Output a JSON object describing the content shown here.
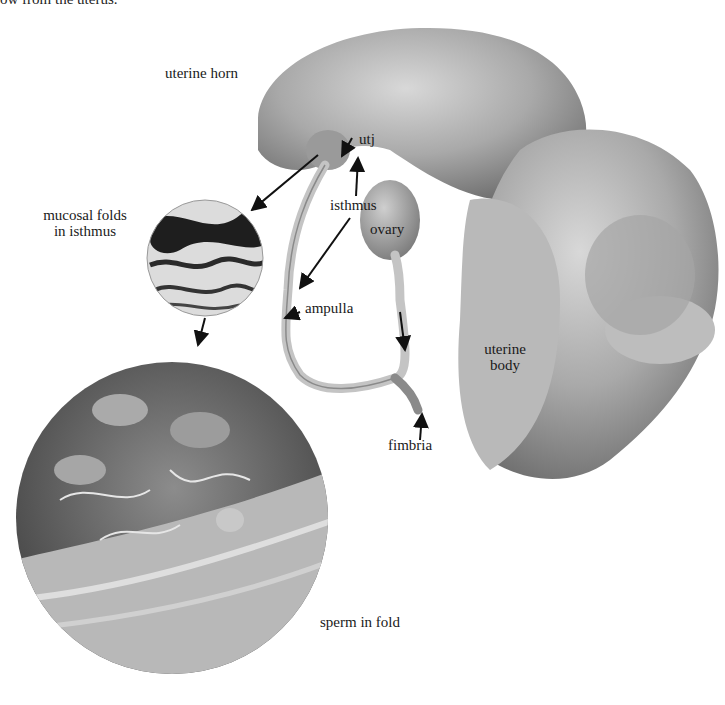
{
  "header_fragment": "ow from the uterus.",
  "figure": {
    "labels": {
      "uterine_horn": "uterine horn",
      "utj": "utj",
      "isthmus": "isthmus",
      "ovary": "ovary",
      "mucosal_folds_line1": "mucosal folds",
      "mucosal_folds_line2": "in isthmus",
      "ampulla": "ampulla",
      "uterine_body_line1": "uterine",
      "uterine_body_line2": "body",
      "fimbria": "fimbria",
      "sperm_in_fold": "sperm in fold"
    },
    "panels": [
      {
        "name": "gross-anatomy-photo",
        "description": "reproductive tract: uterine horn, oviduct, ovary, uterine body"
      },
      {
        "name": "mucosal-folds-micrograph",
        "shape": "circle"
      },
      {
        "name": "sperm-in-fold-micrograph",
        "shape": "circle"
      }
    ]
  }
}
